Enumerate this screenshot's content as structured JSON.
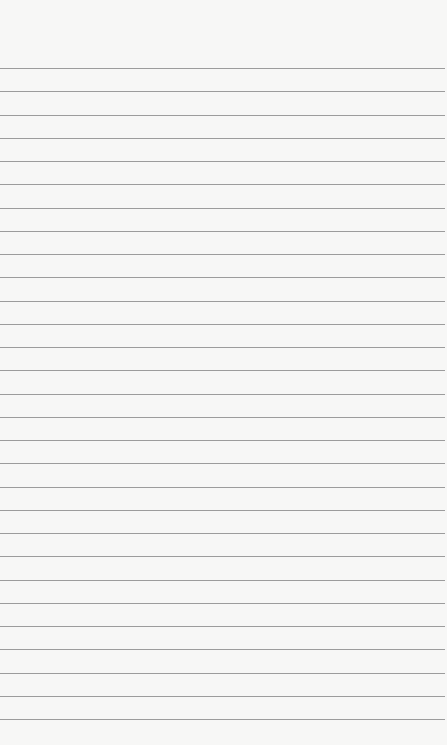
{
  "page": {
    "type": "blank ruled notepad page",
    "background_color": "#f7f7f6",
    "line_color": "#9c9c9c",
    "line_count": 29,
    "first_line_y": 68,
    "line_spacing": 23.25,
    "text": ""
  }
}
